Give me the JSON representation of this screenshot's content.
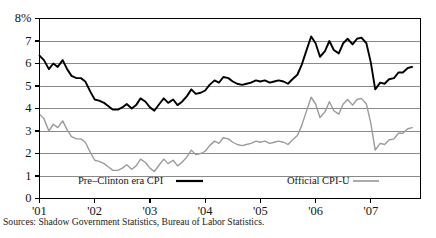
{
  "chart_data": {
    "type": "line",
    "title": "",
    "xlabel": "",
    "ylabel": "",
    "grid": true,
    "legend_position": "inside-bottom",
    "ylim": [
      0,
      8
    ],
    "xlim": [
      2001.0,
      2007.9
    ],
    "y_ticks": [
      "0",
      "1",
      "2",
      "3",
      "4",
      "5",
      "6",
      "7",
      "8%"
    ],
    "y_tick_values": [
      0,
      1,
      2,
      3,
      4,
      5,
      6,
      7,
      8
    ],
    "x_ticks": [
      "'01",
      "'02",
      "'03",
      "'04",
      "'05",
      "'06",
      "'07"
    ],
    "x_tick_values": [
      2001,
      2002,
      2003,
      2004,
      2005,
      2006,
      2007
    ],
    "series": [
      {
        "name": "Pre–Clinton era CPI",
        "color": "#000000",
        "width": 1.9,
        "x": [
          2001.0,
          2001.08,
          2001.17,
          2001.25,
          2001.33,
          2001.42,
          2001.5,
          2001.58,
          2001.67,
          2001.75,
          2001.83,
          2001.92,
          2002.0,
          2002.08,
          2002.17,
          2002.25,
          2002.33,
          2002.42,
          2002.5,
          2002.58,
          2002.67,
          2002.75,
          2002.83,
          2002.92,
          2003.0,
          2003.08,
          2003.17,
          2003.25,
          2003.33,
          2003.42,
          2003.5,
          2003.58,
          2003.67,
          2003.75,
          2003.83,
          2003.92,
          2004.0,
          2004.08,
          2004.17,
          2004.25,
          2004.33,
          2004.42,
          2004.5,
          2004.58,
          2004.67,
          2004.75,
          2004.83,
          2004.92,
          2005.0,
          2005.08,
          2005.17,
          2005.25,
          2005.33,
          2005.42,
          2005.5,
          2005.58,
          2005.67,
          2005.75,
          2005.83,
          2005.92,
          2006.0,
          2006.08,
          2006.17,
          2006.25,
          2006.33,
          2006.42,
          2006.5,
          2006.58,
          2006.67,
          2006.75,
          2006.83,
          2006.92,
          2007.0,
          2007.08,
          2007.17,
          2007.25,
          2007.33,
          2007.42,
          2007.5,
          2007.58,
          2007.67,
          2007.75
        ],
        "y": [
          6.35,
          6.15,
          5.75,
          6.0,
          5.85,
          6.15,
          5.75,
          5.45,
          5.35,
          5.35,
          5.2,
          4.75,
          4.4,
          4.35,
          4.25,
          4.1,
          3.95,
          3.95,
          4.05,
          4.2,
          4.0,
          4.15,
          4.45,
          4.3,
          4.05,
          3.9,
          4.2,
          4.45,
          4.25,
          4.4,
          4.15,
          4.3,
          4.55,
          4.85,
          4.65,
          4.7,
          4.8,
          5.05,
          5.25,
          5.15,
          5.4,
          5.35,
          5.2,
          5.1,
          5.05,
          5.1,
          5.15,
          5.25,
          5.2,
          5.25,
          5.15,
          5.2,
          5.25,
          5.2,
          5.1,
          5.3,
          5.5,
          5.95,
          6.55,
          7.2,
          6.9,
          6.3,
          6.55,
          7.0,
          6.6,
          6.45,
          6.9,
          7.1,
          6.85,
          7.1,
          7.15,
          6.9,
          6.05,
          4.85,
          5.15,
          5.1,
          5.3,
          5.35,
          5.6,
          5.6,
          5.8,
          5.85
        ]
      },
      {
        "name": "Official CPI-U",
        "color": "#9b9b9b",
        "width": 1.4,
        "x": [
          2001.0,
          2001.08,
          2001.17,
          2001.25,
          2001.33,
          2001.42,
          2001.5,
          2001.58,
          2001.67,
          2001.75,
          2001.83,
          2001.92,
          2002.0,
          2002.08,
          2002.17,
          2002.25,
          2002.33,
          2002.42,
          2002.5,
          2002.58,
          2002.67,
          2002.75,
          2002.83,
          2002.92,
          2003.0,
          2003.08,
          2003.17,
          2003.25,
          2003.33,
          2003.42,
          2003.5,
          2003.58,
          2003.67,
          2003.75,
          2003.83,
          2003.92,
          2004.0,
          2004.08,
          2004.17,
          2004.25,
          2004.33,
          2004.42,
          2004.5,
          2004.58,
          2004.67,
          2004.75,
          2004.83,
          2004.92,
          2005.0,
          2005.08,
          2005.17,
          2005.25,
          2005.33,
          2005.42,
          2005.5,
          2005.58,
          2005.67,
          2005.75,
          2005.83,
          2005.92,
          2006.0,
          2006.08,
          2006.17,
          2006.25,
          2006.33,
          2006.42,
          2006.5,
          2006.58,
          2006.67,
          2006.75,
          2006.83,
          2006.92,
          2007.0,
          2007.08,
          2007.17,
          2007.25,
          2007.33,
          2007.42,
          2007.5,
          2007.58,
          2007.67,
          2007.75
        ],
        "y": [
          3.75,
          3.55,
          3.0,
          3.3,
          3.15,
          3.45,
          3.05,
          2.75,
          2.65,
          2.65,
          2.5,
          2.05,
          1.7,
          1.65,
          1.55,
          1.4,
          1.25,
          1.25,
          1.35,
          1.5,
          1.3,
          1.45,
          1.75,
          1.6,
          1.35,
          1.2,
          1.5,
          1.75,
          1.55,
          1.7,
          1.45,
          1.6,
          1.85,
          2.15,
          1.95,
          2.0,
          2.1,
          2.35,
          2.55,
          2.45,
          2.7,
          2.65,
          2.5,
          2.4,
          2.35,
          2.4,
          2.45,
          2.55,
          2.5,
          2.55,
          2.45,
          2.5,
          2.55,
          2.5,
          2.4,
          2.6,
          2.8,
          3.25,
          3.85,
          4.5,
          4.2,
          3.6,
          3.85,
          4.3,
          3.9,
          3.75,
          4.2,
          4.4,
          4.15,
          4.4,
          4.45,
          4.2,
          3.35,
          2.15,
          2.45,
          2.4,
          2.6,
          2.65,
          2.9,
          2.9,
          3.1,
          3.15
        ]
      }
    ]
  },
  "legend": {
    "items": [
      {
        "label": "Pre–Clinton era CPI",
        "color": "#000000",
        "width": 2.2
      },
      {
        "label": "Official CPI-U",
        "color": "#8f8f8f",
        "width": 1.5
      }
    ]
  },
  "source_note": "Sources: Shadow Government Statistics, Bureau of Labor Statistics."
}
